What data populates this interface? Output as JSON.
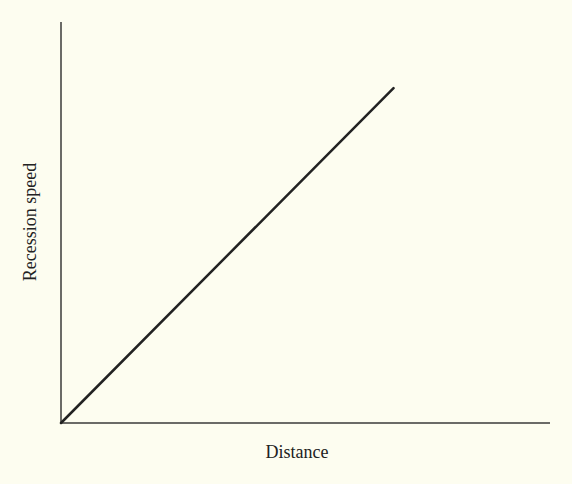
{
  "chart_data": {
    "type": "line",
    "title": "",
    "xlabel": "Distance",
    "ylabel": "Recession speed",
    "grid": false,
    "legend": null,
    "xlim": [
      0,
      1
    ],
    "ylim": [
      0,
      1
    ],
    "series": [
      {
        "name": "Hubble relation",
        "x": [
          0,
          0.68
        ],
        "y": [
          0,
          0.835
        ]
      }
    ],
    "x_ticks": [],
    "y_ticks": []
  },
  "colors": {
    "background": "#fdfdf0",
    "axis": "#333333",
    "line": "#222222"
  }
}
